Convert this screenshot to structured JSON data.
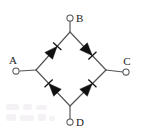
{
  "figure": {
    "type": "circuit-diagram",
    "width": 141,
    "height": 138,
    "background_color": "#ffffff",
    "wire_color": "#555555",
    "diode_color": "#101010",
    "label_color": "#1a1a1a"
  },
  "terminals": [
    {
      "id": "A",
      "label": "A",
      "label_position": "above",
      "x": 14,
      "y": 71,
      "node_x": 36,
      "node_y": 70
    },
    {
      "id": "B",
      "label": "B",
      "label_position": "right",
      "x": 70,
      "y": 16,
      "node_x": 70,
      "node_y": 32
    },
    {
      "id": "C",
      "label": "C",
      "label_position": "above",
      "x": 128,
      "y": 72,
      "node_x": 106,
      "node_y": 70
    },
    {
      "id": "D",
      "label": "D",
      "label_position": "right",
      "x": 70,
      "y": 124,
      "node_x": 70,
      "node_y": 106
    }
  ],
  "bridge_vertices": {
    "top": {
      "x": 70,
      "y": 32
    },
    "left": {
      "x": 36,
      "y": 70
    },
    "right": {
      "x": 106,
      "y": 70
    },
    "bottom": {
      "x": 70,
      "y": 106
    }
  },
  "diodes": [
    {
      "id": "D1",
      "name": "upper-left-diode",
      "from": "A",
      "to": "B",
      "branch": "left-to-top",
      "direction": "up-right",
      "anode_at": "left-vertex",
      "cathode_at": "top-vertex",
      "mid_x": 53,
      "mid_y": 51
    },
    {
      "id": "D2",
      "name": "upper-right-diode",
      "from": "B",
      "to": "C",
      "branch": "top-to-right",
      "direction": "down-right",
      "anode_at": "top-vertex",
      "cathode_at": "right-vertex",
      "mid_x": 88,
      "mid_y": 51
    },
    {
      "id": "D3",
      "name": "lower-left-diode",
      "from": "D",
      "to": "A",
      "branch": "bottom-to-left",
      "direction": "up-left",
      "anode_at": "bottom-vertex",
      "cathode_at": "left-vertex",
      "mid_x": 53,
      "mid_y": 88
    },
    {
      "id": "D4",
      "name": "lower-right-diode",
      "from": "D",
      "to": "C",
      "branch": "bottom-to-right",
      "direction": "up-right",
      "anode_at": "bottom-vertex",
      "cathode_at": "right-vertex",
      "mid_x": 88,
      "mid_y": 88
    }
  ],
  "leads": [
    {
      "id": "lead-A",
      "from_x": 20,
      "from_y": 71,
      "to_x": 36,
      "to_y": 70
    },
    {
      "id": "lead-B",
      "from_x": 70,
      "from_y": 21,
      "to_x": 70,
      "to_y": 32
    },
    {
      "id": "lead-C",
      "from_x": 106,
      "from_y": 70,
      "to_x": 123,
      "to_y": 72
    },
    {
      "id": "lead-D",
      "from_x": 70,
      "from_y": 106,
      "to_x": 70,
      "to_y": 119
    }
  ]
}
